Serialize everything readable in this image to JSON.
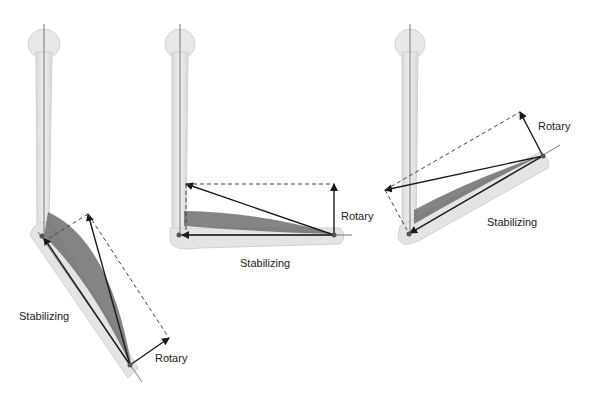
{
  "figure": {
    "panels": [
      {
        "id": "extended",
        "labels": {
          "stabilizing": "Stabilizing",
          "rotary": "Rotary"
        }
      },
      {
        "id": "ninety-degrees",
        "labels": {
          "stabilizing": "Stabilizing",
          "rotary": "Rotary"
        }
      },
      {
        "id": "flexed",
        "labels": {
          "stabilizing": "Stabilizing",
          "rotary": "Rotary"
        }
      }
    ]
  },
  "colors": {
    "bone": "#e6e6e6",
    "bone_edge": "#cfcfcf",
    "muscle": "#6e6e6e",
    "vector": "#1a1a1a",
    "axis_line": "#777777"
  }
}
